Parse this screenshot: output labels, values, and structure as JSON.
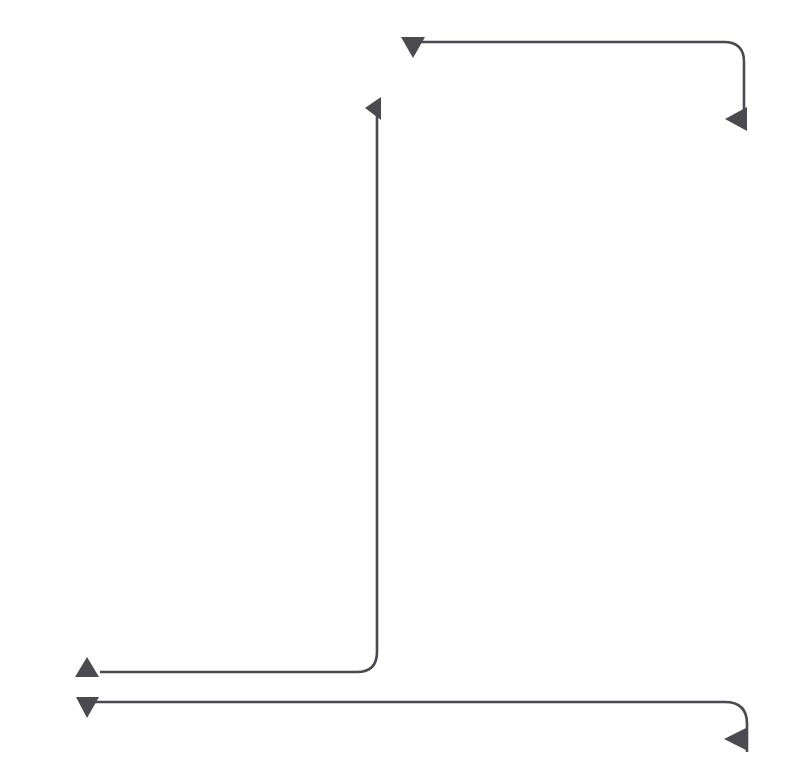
{
  "canvas": {
    "width": 792,
    "height": 760,
    "background_color": "#ffffff",
    "title": "Connector Diagram"
  },
  "style": {
    "stroke_color": "#4a4a50",
    "stroke_width": 2.6,
    "arrow_fill": "#4a4a50",
    "corner_radius": 20,
    "arrow_size": 15
  },
  "connectors": [
    {
      "id": "connector-top",
      "name": "top-connector",
      "label": "",
      "start_arrow": "arrowhead-down",
      "end_arrow": "arrowhead-left",
      "start_point": [
        413,
        48
      ],
      "end_point": [
        737,
        119
      ],
      "path": "M 413 42 L 724 42 Q 744 42 744 62 L 744 128",
      "start_marker": {
        "direction": "down",
        "points": "401,37 425,37 413,58"
      },
      "end_marker": {
        "direction": "left",
        "points": "725,119 747,107 747,131"
      }
    },
    {
      "id": "connector-elbow",
      "name": "elbow-connector",
      "label": "",
      "start_arrow": "arrowhead-left",
      "end_arrow": "arrowhead-up",
      "start_point": [
        366,
        108
      ],
      "end_point": [
        87,
        668
      ],
      "path": "M 377 104 L 377 652 Q 377 672 357 672 L 100 672",
      "start_marker": {
        "direction": "left",
        "points": "365,108 381,97 381,120"
      },
      "end_marker": {
        "direction": "up",
        "points": "87,657 99,677 75,677"
      }
    },
    {
      "id": "connector-bottom",
      "name": "bottom-connector",
      "label": "",
      "start_arrow": "arrowhead-down",
      "end_arrow": "arrowhead-left",
      "start_point": [
        87,
        707
      ],
      "end_point": [
        758,
        739
      ],
      "path": "M 87 702 L 725 702 Q 747 702 747 724 L 747 752",
      "start_marker": {
        "direction": "down",
        "points": "76,697 99,697 87,718"
      },
      "end_marker": {
        "direction": "left",
        "points": "724,739 748,727 748,751"
      }
    }
  ],
  "guides": {
    "left_margin_guide_x": 15,
    "guide_color": "#cfcfcf"
  }
}
